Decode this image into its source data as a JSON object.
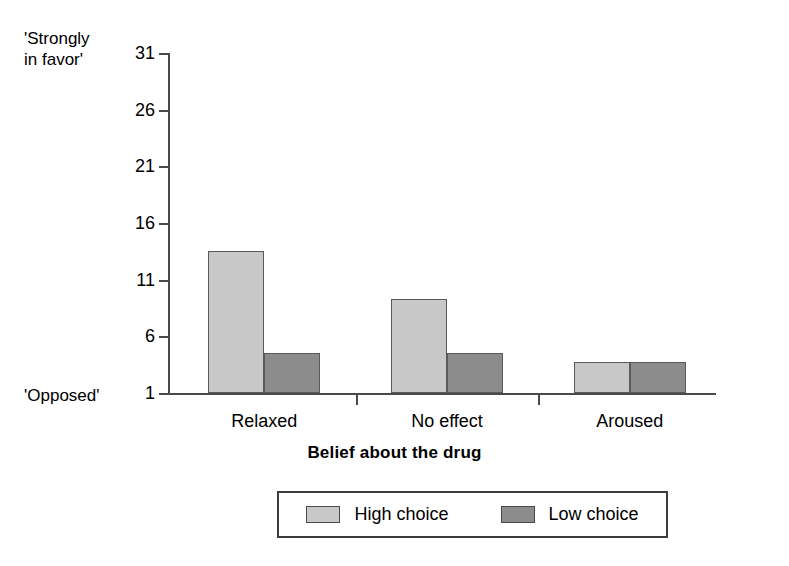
{
  "chart_data": {
    "type": "bar",
    "title": "",
    "subtitle": "",
    "xlabel": "Belief about the drug",
    "ylabel": "",
    "categories": [
      "Relaxed",
      "No effect",
      "Aroused"
    ],
    "series": [
      {
        "name": "High choice",
        "color": "#c8c8c8",
        "values": [
          13.5,
          9.3,
          3.7
        ]
      },
      {
        "name": "Low choice",
        "color": "#8c8c8c",
        "values": [
          4.5,
          4.5,
          3.7
        ]
      }
    ],
    "ylim": [
      1,
      31
    ],
    "yticks": [
      1,
      6,
      11,
      16,
      21,
      26,
      31
    ],
    "ytick_labels": [
      "1",
      "6",
      "11",
      "16",
      "21",
      "26",
      "31"
    ],
    "y_axis_top_label": "'Strongly\nin favor'",
    "y_axis_bottom_label": "'Opposed'",
    "grid": false,
    "legend_position": "bottom"
  },
  "axis": {
    "top_anchor_label": "'Strongly\nin favor'",
    "bottom_anchor_label": "'Opposed'",
    "x_title": "Belief about the drug"
  },
  "legend": {
    "items": [
      {
        "label": "High choice",
        "color": "#c8c8c8"
      },
      {
        "label": "Low choice",
        "color": "#8c8c8c"
      }
    ]
  },
  "colors": {
    "high_choice": "#c8c8c8",
    "low_choice": "#8c8c8c",
    "axis": "#4a4a4a",
    "bar_outline": "#5a5a5a",
    "background": "#ffffff"
  }
}
